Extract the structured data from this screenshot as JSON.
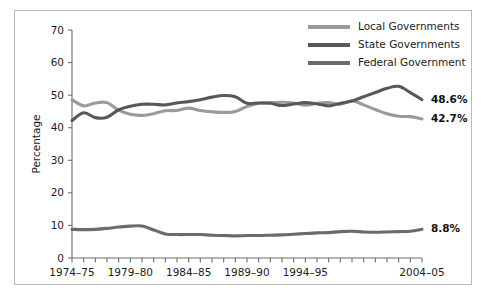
{
  "chart_data": {
    "type": "line",
    "title": "",
    "xlabel": "",
    "ylabel": "Percentage",
    "ylim": [
      0,
      70
    ],
    "yticks": [
      0,
      10,
      20,
      30,
      40,
      50,
      60,
      70
    ],
    "grid": false,
    "legend_position": "top-right",
    "x": [
      "1974-75",
      "1975-76",
      "1976-77",
      "1977-78",
      "1978-79",
      "1979-80",
      "1980-81",
      "1981-82",
      "1982-83",
      "1983-84",
      "1984-85",
      "1985-86",
      "1986-87",
      "1987-88",
      "1988-89",
      "1989-90",
      "1990-91",
      "1991-92",
      "1992-93",
      "1993-94",
      "1994-95",
      "1995-96",
      "1996-97",
      "1997-98",
      "1998-99",
      "1999-2000",
      "2000-01",
      "2001-02",
      "2002-03",
      "2003-04",
      "2004-05"
    ],
    "xtick_labels": [
      "1974-75",
      "1979-80",
      "1984-85",
      "1989-90",
      "1994-95",
      "2004-05"
    ],
    "xtick_indices": [
      0,
      5,
      10,
      15,
      20,
      30
    ],
    "series": [
      {
        "name": "Local Governments",
        "color": "#9a9a9a",
        "end_label": "42.7%",
        "values": [
          48.6,
          46.7,
          47.6,
          47.7,
          45.4,
          44.1,
          43.8,
          44.3,
          45.2,
          45.3,
          46.0,
          45.3,
          44.9,
          44.7,
          45.0,
          46.5,
          47.5,
          47.7,
          47.8,
          47.6,
          46.9,
          47.5,
          47.7,
          47.2,
          48.3,
          47.0,
          45.6,
          44.3,
          43.5,
          43.4,
          42.7
        ]
      },
      {
        "name": "State Governments",
        "color": "#585858",
        "end_label": "48.6%",
        "values": [
          42.2,
          44.6,
          43.1,
          43.2,
          45.5,
          46.6,
          47.2,
          47.2,
          47.0,
          47.6,
          48.0,
          48.6,
          49.4,
          49.9,
          49.5,
          47.5,
          47.6,
          47.5,
          46.8,
          47.3,
          47.7,
          47.3,
          46.7,
          47.5,
          48.2,
          49.5,
          50.8,
          52.1,
          52.7,
          50.8,
          48.6
        ]
      },
      {
        "name": "Federal Government",
        "color": "#6b6b6b",
        "end_label": "8.8%",
        "values": [
          8.8,
          8.7,
          8.8,
          9.1,
          9.5,
          9.8,
          9.8,
          8.6,
          7.4,
          7.2,
          7.2,
          7.2,
          7.0,
          6.9,
          6.8,
          6.9,
          6.9,
          7.0,
          7.1,
          7.3,
          7.5,
          7.7,
          7.8,
          8.1,
          8.2,
          8.0,
          7.9,
          8.0,
          8.1,
          8.2,
          8.8
        ]
      }
    ],
    "annotations": [
      {
        "text": "48.6%",
        "series": "State Governments"
      },
      {
        "text": "42.7%",
        "series": "Local Governments"
      },
      {
        "text": "8.8%",
        "series": "Federal Government"
      }
    ]
  },
  "legend": {
    "items": [
      {
        "label": "Local Governments"
      },
      {
        "label": "State Governments"
      },
      {
        "label": "Federal Government"
      }
    ]
  },
  "colors": {
    "local": "#9a9a9a",
    "state": "#585858",
    "federal": "#6b6b6b",
    "axis": "#6e6e6e",
    "frame": "#b9b9b9",
    "text": "#1c1c1c"
  }
}
